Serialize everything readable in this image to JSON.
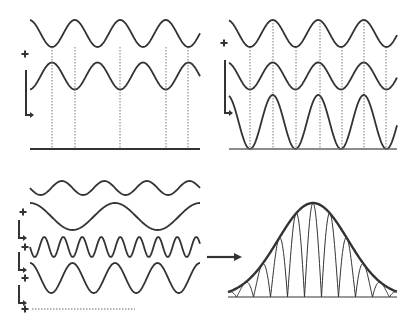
{
  "diagram": {
    "colors": {
      "stroke": "#333333",
      "dotted": "#555555",
      "background": "#ffffff"
    },
    "panels": [
      {
        "id": "top-left",
        "title": "",
        "waves": [
          {
            "name": "wave-a",
            "cycles": 3.7,
            "amplitude": "small",
            "phase": "peak at dotted line"
          },
          {
            "name": "wave-b",
            "cycles": 3.7,
            "amplitude": "small",
            "phase": "opposite (180 deg)"
          }
        ],
        "result": "flat line (destructive interference)",
        "operator_symbol": "+"
      },
      {
        "id": "top-right",
        "title": "",
        "waves": [
          {
            "name": "wave-a",
            "cycles": 3.7,
            "amplitude": "small",
            "phase": "in phase"
          },
          {
            "name": "wave-b",
            "cycles": 3.7,
            "amplitude": "small",
            "phase": "in phase"
          }
        ],
        "result": "doubled amplitude wave (constructive interference)",
        "operator_symbol": "+"
      },
      {
        "id": "bottom-left",
        "title": "",
        "waves": [
          {
            "name": "wave-1",
            "cycles": 4
          },
          {
            "name": "wave-2",
            "cycles": 2
          },
          {
            "name": "wave-3",
            "cycles": 9
          },
          {
            "name": "wave-4",
            "cycles": 4
          }
        ],
        "continuation": "dotted line (more terms)",
        "operator_symbols": [
          "+",
          "+",
          "+",
          "+"
        ]
      },
      {
        "id": "bottom-right",
        "title": "",
        "result": "wave packet with Gaussian envelope"
      }
    ],
    "arrow_label": ""
  }
}
